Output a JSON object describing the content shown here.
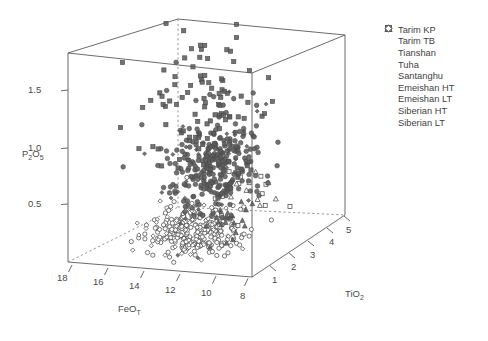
{
  "chart_data": {
    "type": "scatter",
    "projection": "3d-scatter-box",
    "title": "",
    "xlabel": "FeO",
    "xlabel_sub": "T",
    "ylabel": "P",
    "ylabel_sub1": "2",
    "ylabel_mid": "O",
    "ylabel_sub2": "5",
    "zlabel": "TiO",
    "zlabel_sub": "2",
    "axes": {
      "x": {
        "name": "FeOT",
        "ticks": [
          18,
          16,
          14,
          12,
          10,
          8
        ],
        "range": [
          19,
          7
        ],
        "direction": "decreasing-left-to-right"
      },
      "y": {
        "name": "P2O5",
        "ticks": [
          1.5,
          1.0,
          0.5
        ],
        "range": [
          0.05,
          1.85
        ]
      },
      "z": {
        "name": "TiO2",
        "ticks": [
          1,
          2,
          3,
          4,
          5
        ],
        "range": [
          0.4,
          5.5
        ]
      }
    },
    "grid": false,
    "legend_position": "right-top",
    "series": [
      {
        "name": "Tarim KP",
        "marker": "filled-square",
        "count": 96
      },
      {
        "name": "Tarim TB",
        "marker": "open-square",
        "count": 14
      },
      {
        "name": "Tianshan",
        "marker": "filled-triangle",
        "count": 12
      },
      {
        "name": "Tuha",
        "marker": "filled-triangle",
        "count": 10
      },
      {
        "name": "Santanghu",
        "marker": "open-triangle",
        "count": 9
      },
      {
        "name": "Emeishan HT",
        "marker": "filled-circle",
        "count": 268
      },
      {
        "name": "Emeishan LT",
        "marker": "open-circle",
        "count": 236
      },
      {
        "name": "Siberian HT",
        "marker": "filled-diamond",
        "count": 46
      },
      {
        "name": "Siberian LT",
        "marker": "open-diamond",
        "count": 60
      }
    ]
  },
  "legend": {
    "items": [
      {
        "label": "Tarim KP",
        "marker": "filled-square"
      },
      {
        "label": "Tarim TB",
        "marker": "open-square"
      },
      {
        "label": "Tianshan",
        "marker": "filled-triangle"
      },
      {
        "label": "Tuha",
        "marker": "filled-triangle"
      },
      {
        "label": "Santanghu",
        "marker": "open-triangle"
      },
      {
        "label": "Emeishan HT",
        "marker": "filled-circle"
      },
      {
        "label": "Emeishan LT",
        "marker": "open-circle"
      },
      {
        "label": "Siberian HT",
        "marker": "filled-diamond"
      },
      {
        "label": "Siberian LT",
        "marker": "open-diamond"
      }
    ]
  },
  "ticks": {
    "y": [
      "1.5",
      "1.0",
      "0.5"
    ],
    "x": [
      "18",
      "16",
      "14",
      "12",
      "10",
      "8"
    ],
    "z": [
      "1",
      "2",
      "3",
      "4",
      "5"
    ]
  },
  "colors": {
    "marker_fill": "#5b5b5b",
    "marker_stroke": "#4a4a4a",
    "axis": "#5a5a5a",
    "text": "#3f3f3f",
    "background": "#ffffff"
  }
}
